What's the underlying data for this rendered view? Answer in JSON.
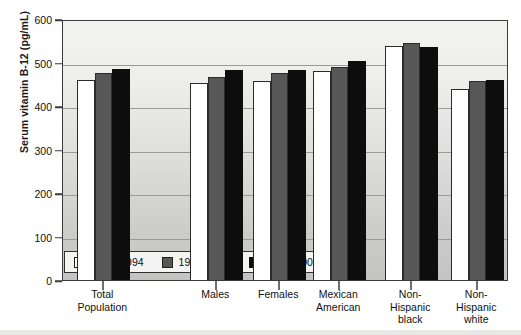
{
  "chart_data": {
    "type": "bar",
    "title": "",
    "xlabel": "",
    "ylabel": "Serum vitamin B-12 (pg/mL)",
    "ylim": [
      0,
      600
    ],
    "yticks": [
      0,
      100,
      200,
      300,
      400,
      500,
      600
    ],
    "grid": true,
    "legend_position": "inside-bottom-left",
    "categories": [
      "Total Population",
      "Males",
      "Females",
      "Mexican American",
      "Non-Hispanic black",
      "Non-Hispanic white"
    ],
    "category_lines": [
      [
        "Total",
        "Population"
      ],
      [
        "Males"
      ],
      [
        "Females"
      ],
      [
        "Mexican",
        "American"
      ],
      [
        "Non-",
        "Hispanic",
        "black"
      ],
      [
        "Non-",
        "Hispanic",
        "white"
      ]
    ],
    "series": [
      {
        "name": "1991–1994",
        "color": "#ffffff",
        "values": [
          465,
          458,
          463,
          485,
          542,
          443
        ]
      },
      {
        "name": "1999–2002",
        "color": "#575757",
        "values": [
          480,
          472,
          481,
          495,
          550,
          462
        ]
      },
      {
        "name": "2003–2006",
        "color": "#0d0d0d",
        "values": [
          490,
          488,
          488,
          508,
          540,
          465
        ]
      }
    ]
  },
  "legend": {
    "items": [
      {
        "label": "1991–1994",
        "swatch": "white-square-icon"
      },
      {
        "label": "1999–2002",
        "swatch": "gray-square-icon"
      },
      {
        "label": "2003–2006",
        "swatch": "black-square-icon"
      }
    ]
  },
  "axes": {
    "y_title": "Serum vitamin B-12 (pg/mL)",
    "y_tick_labels": [
      "600",
      "500",
      "400",
      "300",
      "200",
      "100",
      "0"
    ]
  }
}
